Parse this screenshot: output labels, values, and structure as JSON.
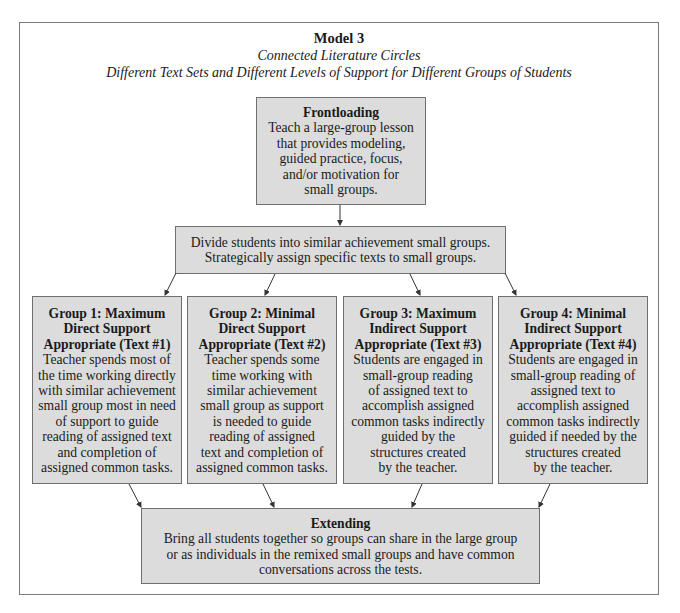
{
  "header": {
    "title": "Model 3",
    "subtitle1": "Connected Literature Circles",
    "subtitle2": "Different Text Sets and Different Levels of Support for Different Groups of Students"
  },
  "frontloading": {
    "heading": "Frontloading",
    "lines": [
      "Teach a large-group lesson",
      "that provides modeling,",
      "guided practice, focus,",
      "and/or motivation for",
      "small groups."
    ]
  },
  "divide": {
    "lines": [
      "Divide students into similar achievement small groups.",
      "Strategically assign specific texts to small groups."
    ]
  },
  "groups": [
    {
      "heading": [
        "Group 1: Maximum",
        "Direct Support",
        "Appropriate (Text #1)"
      ],
      "lines": [
        "Teacher spends most of",
        "the time working directly",
        "with similar achievement",
        "small group most in need",
        "of support to guide",
        "reading of assigned text",
        "and completion of",
        "assigned common tasks."
      ]
    },
    {
      "heading": [
        "Group 2: Minimal",
        "Direct Support",
        "Appropriate (Text #2)"
      ],
      "lines": [
        "Teacher spends some",
        "time working with",
        "similar achievement",
        "small group as support",
        "is needed to guide",
        "reading of assigned",
        "text and completion of",
        "assigned common tasks."
      ]
    },
    {
      "heading": [
        "Group 3: Maximum",
        "Indirect Support",
        "Appropriate (Text #3)"
      ],
      "lines": [
        "Students are engaged in",
        "small-group reading",
        "of assigned text to",
        "accomplish assigned",
        "common tasks indirectly",
        "guided by the",
        "structures created",
        "by the teacher."
      ]
    },
    {
      "heading": [
        "Group 4: Minimal",
        "Indirect Support",
        "Appropriate (Text #4)"
      ],
      "lines": [
        "Students are engaged in",
        "small-group reading of",
        "assigned text to",
        "accomplish assigned",
        "common tasks indirectly",
        "guided if needed by the",
        "structures created",
        "by the teacher."
      ]
    }
  ],
  "extending": {
    "heading": "Extending",
    "lines": [
      "Bring all students together so groups can share in the large group",
      "or as individuals in the remixed small groups and have common",
      "conversations across the tests."
    ]
  },
  "colors": {
    "box_fill": "#dcdcdc",
    "box_border": "#6f6f6f",
    "frame_border": "#7a7a7a",
    "arrow": "#333333"
  }
}
